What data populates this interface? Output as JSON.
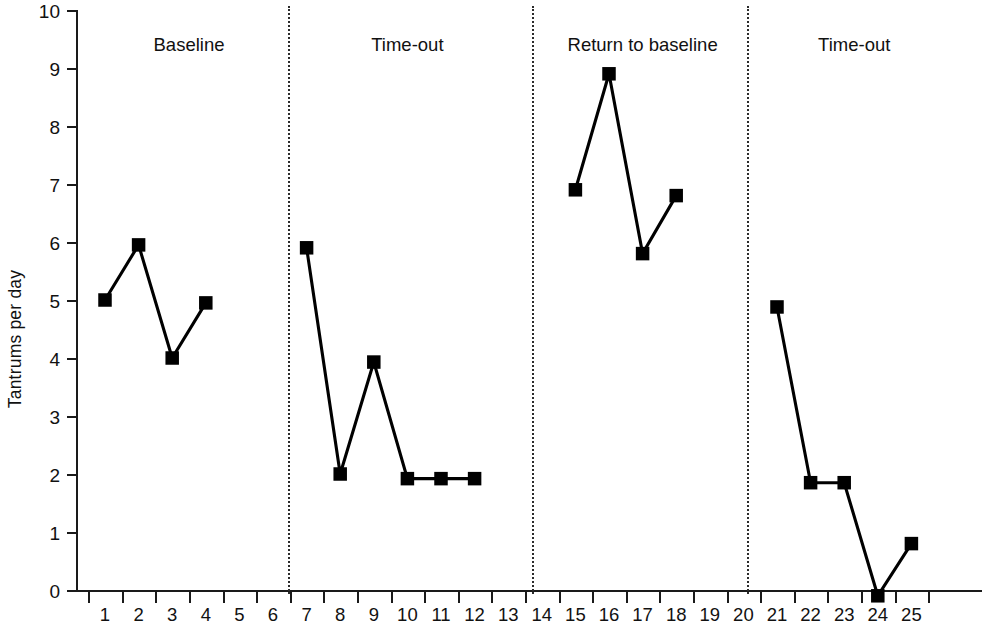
{
  "chart_data": {
    "type": "line",
    "title": "",
    "xlabel": "",
    "ylabel": "Tantrums per day",
    "xlim": [
      0,
      26
    ],
    "ylim": [
      0,
      10
    ],
    "yticks": [
      0,
      1,
      2,
      3,
      4,
      5,
      6,
      7,
      8,
      9,
      10
    ],
    "xticks": [
      1,
      2,
      3,
      4,
      5,
      6,
      7,
      8,
      9,
      10,
      11,
      12,
      13,
      14,
      15,
      16,
      17,
      18,
      19,
      20,
      21,
      22,
      23,
      24,
      25
    ],
    "grid": false,
    "legend": null,
    "marker": "filled-square",
    "line_color": "#000000",
    "series": [
      {
        "name": "Baseline",
        "x": [
          1,
          2,
          3,
          4
        ],
        "values": [
          5.0,
          5.95,
          4.0,
          4.95
        ]
      },
      {
        "name": "Time-out",
        "x": [
          7,
          8,
          9,
          10,
          11,
          12
        ],
        "values": [
          5.9,
          2.0,
          3.93,
          1.92,
          1.92,
          1.92
        ]
      },
      {
        "name": "Return to baseline",
        "x": [
          15,
          16,
          17,
          18
        ],
        "values": [
          6.9,
          8.9,
          5.8,
          6.8
        ]
      },
      {
        "name": "Time-out",
        "x": [
          21,
          22,
          23,
          24,
          25
        ],
        "values": [
          4.88,
          1.85,
          1.85,
          -0.1,
          0.8
        ]
      }
    ],
    "phases": [
      {
        "label": "Baseline",
        "center_day": 3.5,
        "start_day": 1,
        "end_day": 4
      },
      {
        "label": "Time-out",
        "center_day": 10.0,
        "start_day": 7,
        "end_day": 12
      },
      {
        "label": "Return to baseline",
        "center_day": 17.0,
        "start_day": 15,
        "end_day": 18
      },
      {
        "label": "Time-out",
        "center_day": 23.3,
        "start_day": 21,
        "end_day": 25
      }
    ],
    "dividers": [
      {
        "after_day": 6.95
      },
      {
        "after_day": 14.2
      },
      {
        "after_day": 20.6
      }
    ],
    "annotations": []
  }
}
